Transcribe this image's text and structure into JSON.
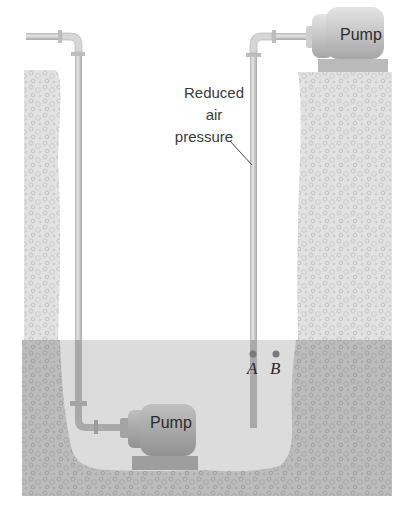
{
  "diagram": {
    "labels": {
      "reduced_air_pressure": [
        "Reduced",
        "air",
        "pressure"
      ],
      "point_a": "A",
      "point_b": "B",
      "top_pump": "Pump",
      "bottom_pump": "Pump"
    },
    "colors": {
      "background": "#ffffff",
      "ground_light": "#dcdcdc",
      "ground_dark": "#b4b4b4",
      "water": "#d9d9d9",
      "pipe": "#c8c8c8",
      "pipe_submerged": "#a9a9a9",
      "pump_body": "#c4c4c4",
      "pump_body_submerged": "#a8a8a8",
      "point_marker": "#7a7a7a",
      "text": "#333333"
    }
  }
}
